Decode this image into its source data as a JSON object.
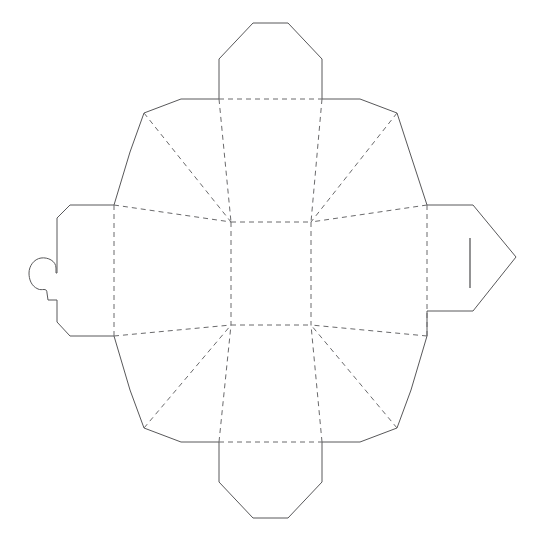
{
  "document": {
    "title": "Box Dieline Template",
    "type": "packaging-die-cut-template",
    "background_color": "#ffffff",
    "canvas": {
      "width": 540,
      "height": 542
    }
  },
  "legend": {
    "cut_line_color": "#58585a",
    "fold_line_color": "#6a6a6c",
    "slit_line_color": "#4a4a4c",
    "cut_line_style": "solid",
    "fold_line_style": "dashed"
  },
  "geometry": {
    "outline": "M 253,23 L 288,23 L 322,59 L 322,99 L 360,99 L 397,113 L 410,153 L 427,205 L 473,205 L 516,257 L 473,311 L 427,336 L 411,390 L 397,428 L 360,442 L 322,442 L 322,482 L 288,518 L 253,518 L 219,482 L 219,442 L 181,442 L 144,428 L 130,390 L 114,336 L 70,336 L 57,322 L 57,300 L 46,300 L 46,293 L 37,290 L 31,282 L 31,268 L 36,258 L 45,254 L 54,257 L 57,263 L 57,218 L 70,205 L 114,205 L 130,152 L 144,113 L 181,99 L 219,99 L 219,59 Z",
    "center_panel": "M 231,222 L 311,222 L 311,325 L 231,325 Z",
    "fold_lines": [
      "M 219,99 L 219,59",
      "M 322,99 L 322,59",
      "M 219,442 L 219,482",
      "M 322,442 L 322,482",
      "M 219,99 L 322,99",
      "M 219,442 L 322,442",
      "M 219,99 L 231,222",
      "M 322,99 L 311,222",
      "M 219,442 L 231,325",
      "M 322,442 L 311,325",
      "M 114,205 L 231,222",
      "M 427,205 L 311,222",
      "M 114,336 L 231,325",
      "M 427,336 L 311,325",
      "M 114,205 L 114,336",
      "M 427,205 L 427,336",
      "M 144,113 L 231,222",
      "M 397,113 L 311,222",
      "M 144,428 L 231,325",
      "M 397,428 L 311,325",
      "M 231,222 L 311,222",
      "M 231,325 L 311,325",
      "M 231,222 L 231,325",
      "M 311,222 L 311,325"
    ],
    "slit": "M 470,238 L 470,288"
  },
  "parts": {
    "top_flap": "top-closure-flap",
    "bottom_flap": "bottom-closure-flap",
    "left_tab": "left-locking-tab-with-notch",
    "right_tab": "right-insert-tab-with-slit",
    "center_panel": "base-panel",
    "side_panels": [
      "top-wall-panel",
      "right-wall-panel",
      "bottom-wall-panel",
      "left-wall-panel"
    ],
    "corner_gussets": [
      "top-left-gusset",
      "top-right-gusset",
      "bottom-right-gusset",
      "bottom-left-gusset"
    ]
  }
}
